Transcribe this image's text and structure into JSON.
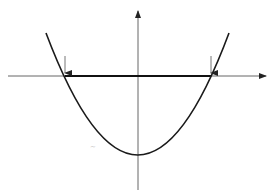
{
  "diagram": {
    "type": "parabola-with-roots",
    "colors": {
      "background": "#ffffff",
      "curve": "#1a1a1a",
      "axis": "#555555",
      "segment": "#111111",
      "arrow": "#444444"
    },
    "axes": {
      "x": {
        "from": [
          8,
          76
        ],
        "to": [
          267,
          76
        ],
        "arrowhead": "right"
      },
      "y": {
        "from": [
          138,
          190
        ],
        "to": [
          138,
          10
        ],
        "arrowhead": "up"
      }
    },
    "parabola": {
      "vertex": [
        138,
        155
      ],
      "roots_x": [
        65,
        211
      ],
      "left_end": [
        46,
        33
      ],
      "right_end": [
        229,
        33
      ]
    },
    "root_markers": [
      {
        "x": 65,
        "label": "left-root-arrow"
      },
      {
        "x": 211,
        "label": "right-root-arrow"
      }
    ],
    "bold_segment": {
      "x1": 65,
      "x2": 211,
      "y": 76
    },
    "artifact_mark": "~"
  }
}
